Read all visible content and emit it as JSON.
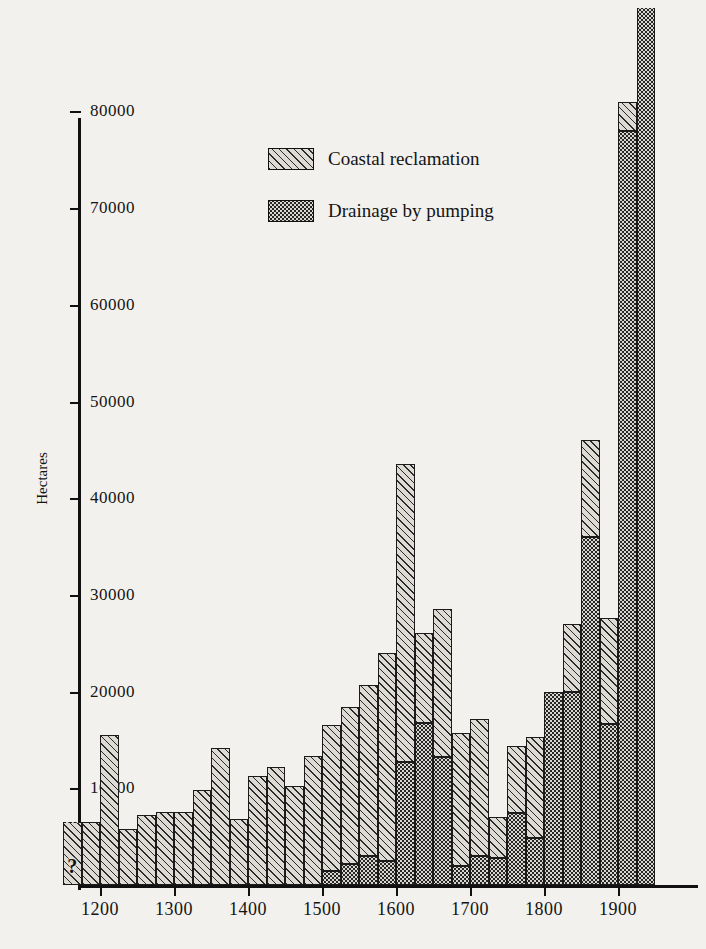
{
  "chart_data": {
    "type": "bar",
    "title": "",
    "xlabel": "",
    "ylabel": "Hectares",
    "xlim": [
      1150,
      1950
    ],
    "ylim": [
      0,
      83000
    ],
    "grid": false,
    "stacked": true,
    "bar_interval_years": 25,
    "legend_position": "upper-center",
    "y_ticks": [
      10000,
      20000,
      30000,
      40000,
      50000,
      60000,
      70000,
      80000
    ],
    "y_tick_labels": [
      "10000",
      "20000",
      "30000",
      "40000",
      "50000",
      "60000",
      "70000",
      "80000"
    ],
    "x_ticks": [
      1200,
      1300,
      1400,
      1500,
      1600,
      1700,
      1800,
      1900
    ],
    "x_tick_labels": [
      "1200",
      "1300",
      "1400",
      "1500",
      "1600",
      "1700",
      "1800",
      "1900"
    ],
    "series": [
      {
        "name": "Coastal reclamation",
        "pattern": "diagonal-hatch"
      },
      {
        "name": "Drainage by pumping",
        "pattern": "stipple"
      }
    ],
    "annotations": [
      {
        "text": "?",
        "period": "1150-1175",
        "note": "value uncertain, dashed top edge"
      },
      {
        "text": "off-scale",
        "period": "1925-1950",
        "note": "bar extends above top of frame"
      }
    ],
    "bars": [
      {
        "period_start": 1150,
        "coastal": 6500,
        "pumping": 0,
        "total": 6500,
        "uncertain": true,
        "label": "?"
      },
      {
        "period_start": 1175,
        "coastal": 6500,
        "pumping": 0,
        "total": 6500
      },
      {
        "period_start": 1200,
        "coastal": 15500,
        "pumping": 0,
        "total": 15500
      },
      {
        "period_start": 1225,
        "coastal": 5800,
        "pumping": 0,
        "total": 5800
      },
      {
        "period_start": 1250,
        "coastal": 7200,
        "pumping": 0,
        "total": 7200
      },
      {
        "period_start": 1275,
        "coastal": 7500,
        "pumping": 0,
        "total": 7500
      },
      {
        "period_start": 1300,
        "coastal": 7500,
        "pumping": 0,
        "total": 7500
      },
      {
        "period_start": 1325,
        "coastal": 9800,
        "pumping": 0,
        "total": 9800
      },
      {
        "period_start": 1350,
        "coastal": 14200,
        "pumping": 0,
        "total": 14200
      },
      {
        "period_start": 1375,
        "coastal": 6800,
        "pumping": 0,
        "total": 6800
      },
      {
        "period_start": 1400,
        "coastal": 11300,
        "pumping": 0,
        "total": 11300
      },
      {
        "period_start": 1425,
        "coastal": 12200,
        "pumping": 0,
        "total": 12200
      },
      {
        "period_start": 1450,
        "coastal": 10200,
        "pumping": 0,
        "total": 10200
      },
      {
        "period_start": 1475,
        "coastal": 13300,
        "pumping": 0,
        "total": 13300
      },
      {
        "period_start": 1500,
        "coastal": 15000,
        "pumping": 1500,
        "total": 16500
      },
      {
        "period_start": 1525,
        "coastal": 16200,
        "pumping": 2200,
        "total": 18400
      },
      {
        "period_start": 1550,
        "coastal": 17700,
        "pumping": 3000,
        "total": 20700
      },
      {
        "period_start": 1575,
        "coastal": 21500,
        "pumping": 2500,
        "total": 24000
      },
      {
        "period_start": 1600,
        "coastal": 30800,
        "pumping": 12700,
        "total": 43500
      },
      {
        "period_start": 1625,
        "coastal": 9300,
        "pumping": 16800,
        "total": 26100
      },
      {
        "period_start": 1650,
        "coastal": 15300,
        "pumping": 13200,
        "total": 28500
      },
      {
        "period_start": 1675,
        "coastal": 13700,
        "pumping": 2000,
        "total": 15700
      },
      {
        "period_start": 1700,
        "coastal": 14200,
        "pumping": 3000,
        "total": 17200
      },
      {
        "period_start": 1725,
        "coastal": 4200,
        "pumping": 2800,
        "total": 7000
      },
      {
        "period_start": 1750,
        "coastal": 7000,
        "pumping": 7400,
        "total": 14400
      },
      {
        "period_start": 1775,
        "coastal": 10400,
        "pumping": 4900,
        "total": 15300
      },
      {
        "period_start": 1800,
        "coastal": 0,
        "pumping": 20000,
        "total": 20000
      },
      {
        "period_start": 1825,
        "coastal": 7000,
        "pumping": 20000,
        "total": 27000
      },
      {
        "period_start": 1850,
        "coastal": 10000,
        "pumping": 36000,
        "total": 46000
      },
      {
        "period_start": 1875,
        "coastal": 11000,
        "pumping": 16600,
        "total": 27600
      },
      {
        "period_start": 1900,
        "coastal": 3000,
        "pumping": 78000,
        "total": 81000
      },
      {
        "period_start": 1925,
        "coastal": 0,
        "pumping": 90000,
        "total": 90000,
        "off_scale": true
      }
    ]
  },
  "legend": {
    "items": [
      {
        "label": "Coastal reclamation",
        "pattern": "diagonal-hatch"
      },
      {
        "label": "Drainage by pumping",
        "pattern": "stipple"
      }
    ]
  },
  "axis": {
    "y_title": "Hectares"
  }
}
